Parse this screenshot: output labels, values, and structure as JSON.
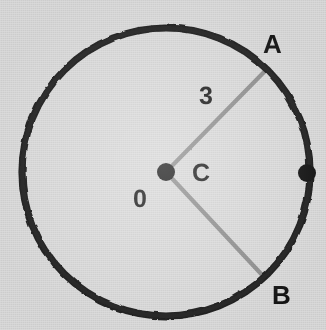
{
  "figure": {
    "background_color": "#d9d9d9",
    "ink_color": "#141414",
    "radius_line_color": "#8c8c8c",
    "canvas": {
      "width": 326,
      "height": 330
    }
  },
  "circle": {
    "name": "main-circle",
    "center_x": 166,
    "center_y": 172,
    "radius": 144,
    "stroke_width": 7,
    "stroke_color": "#141414"
  },
  "points": [
    {
      "id": "center",
      "label": "0",
      "marker": "filled-dot",
      "x": 166,
      "y": 172,
      "dot_radius": 9,
      "label_x": 133,
      "label_y": 187
    },
    {
      "id": "A",
      "label": "A",
      "marker": "none",
      "x": 266,
      "y": 70,
      "label_x": 263,
      "label_y": 31
    },
    {
      "id": "B",
      "label": "B",
      "marker": "none",
      "x": 264,
      "y": 277,
      "label_x": 272,
      "label_y": 282
    },
    {
      "id": "right-edge-point",
      "label": "",
      "marker": "filled-dot",
      "x": 307,
      "y": 173,
      "dot_radius": 9
    }
  ],
  "segments": [
    {
      "id": "radius-OA",
      "from": "center",
      "to": "A",
      "x1": 166,
      "y1": 172,
      "x2": 266,
      "y2": 70,
      "stroke_color": "#8c8c8c",
      "stroke_width": 4,
      "length_label": "3"
    },
    {
      "id": "radius-OB",
      "from": "center",
      "to": "B",
      "x1": 166,
      "y1": 172,
      "x2": 264,
      "y2": 277,
      "stroke_color": "#8c8c8c",
      "stroke_width": 4,
      "length_label": ""
    }
  ],
  "labels": {
    "point_a": "A",
    "point_b": "B",
    "angle_c": "C",
    "radius_length": "3",
    "center_o": "0"
  }
}
